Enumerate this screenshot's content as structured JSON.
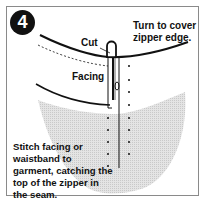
{
  "diagram": {
    "step_number": "4",
    "labels": {
      "turn": "Turn to cover zipper edge.",
      "cut": "Cut",
      "facing": "Facing",
      "stitch": "Stitch facing or waistband to garment, catching the top of the zipper in the seam."
    },
    "colors": {
      "garment_fill": "#d9d9d9",
      "line": "#111111",
      "badge": "#111111",
      "frame": "#8a8a8a"
    }
  }
}
